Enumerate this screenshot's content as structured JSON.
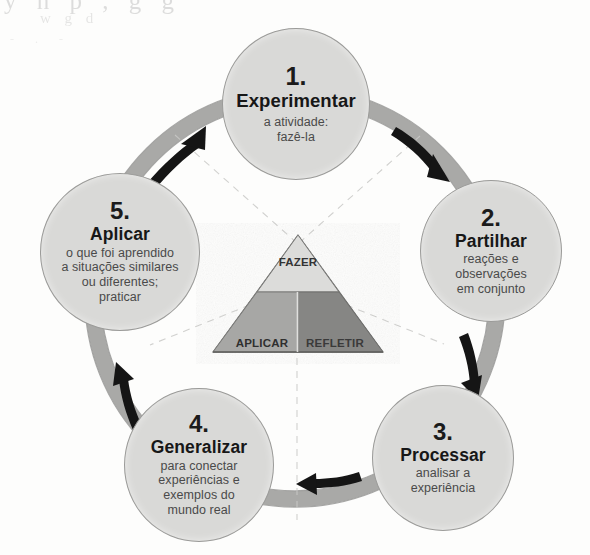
{
  "diagram": {
    "kind": "experiential-learning-cycle",
    "colors": {
      "ring": "#a9a9a7",
      "ring_edge": "#8e8e8c",
      "node_fill": "#d9d9d7",
      "node_stroke": "#9b9b99",
      "arrow": "#151515",
      "triangle_top": "#dcdcda",
      "triangle_left": "#a7a7a5",
      "triangle_right": "#8a8a88",
      "triangle_base": "#9d9d9b",
      "dashed_line": "#c9c9c7",
      "background": "#fdfdfc"
    }
  },
  "nodes": [
    {
      "number": "1.",
      "title": "Experimentar",
      "description": [
        "a atividade:",
        "fazê-la"
      ]
    },
    {
      "number": "2.",
      "title": "Partilhar",
      "description": [
        "reações e",
        "observações",
        "em conjunto"
      ]
    },
    {
      "number": "3.",
      "title": "Processar",
      "description": [
        "analisar a",
        "experiência"
      ]
    },
    {
      "number": "4.",
      "title": "Generalizar",
      "description": [
        "para conectar",
        "experiências e",
        "exemplos do",
        "mundo real"
      ]
    },
    {
      "number": "5.",
      "title": "Aplicar",
      "description": [
        "o que foi aprendido",
        "a situações similares",
        "ou diferentes;",
        "praticar"
      ]
    }
  ],
  "triangle": {
    "top_label": "FAZER",
    "left_label": "APLICAR",
    "right_label": "REFLETIR"
  },
  "arrows": [
    {
      "name": "arrow-5-to-1",
      "direction": "clockwise"
    },
    {
      "name": "arrow-1-to-2",
      "direction": "clockwise"
    },
    {
      "name": "arrow-2-to-3",
      "direction": "clockwise"
    },
    {
      "name": "arrow-3-to-4",
      "direction": "clockwise"
    },
    {
      "name": "arrow-4-to-5",
      "direction": "clockwise"
    }
  ],
  "artifact": {
    "line1": "y     n   p         ,   g  g",
    "line2": "w      g            d",
    "line3": "-       .       -"
  }
}
